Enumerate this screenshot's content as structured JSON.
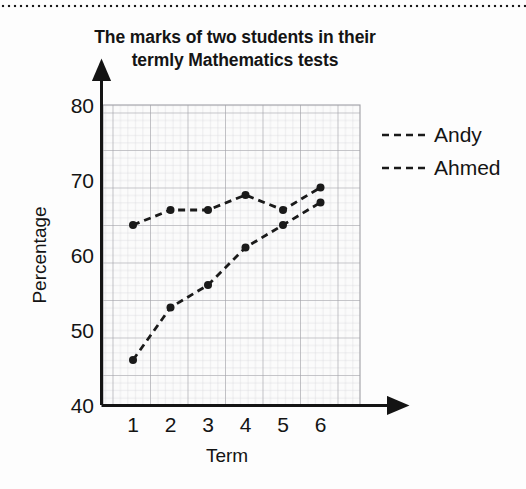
{
  "chart_data": {
    "type": "line",
    "title": "The marks of two students in their termly Mathematics tests",
    "title_line1": "The marks of two students in their",
    "title_line2": "termly Mathematics tests",
    "xlabel": "Term",
    "ylabel": "Percentage",
    "categories": [
      "1",
      "2",
      "3",
      "4",
      "5",
      "6"
    ],
    "x": [
      1,
      2,
      3,
      4,
      5,
      6
    ],
    "xlim": [
      0.4,
      6.6
    ],
    "ylim": [
      40,
      80
    ],
    "ytick_labels": [
      "40",
      "50",
      "60",
      "70",
      "80"
    ],
    "yticks": [
      40,
      50,
      60,
      70,
      80
    ],
    "xtick_labels": [
      "1",
      "2",
      "3",
      "4",
      "5",
      "6"
    ],
    "grid": true,
    "grid_minor": true,
    "legend_position": "right",
    "line_style": "dashed",
    "marker": "circle",
    "series": [
      {
        "name": "Andy",
        "values": [
          46,
          53,
          56,
          61,
          64,
          67
        ],
        "color": "#1a1a1a",
        "dash": "dashed"
      },
      {
        "name": "Ahmed",
        "values": [
          64,
          66,
          66,
          68,
          66,
          69
        ],
        "color": "#1a1a1a",
        "dash": "dashed"
      }
    ]
  },
  "legend": {
    "items": [
      {
        "label": "Andy"
      },
      {
        "label": "Ahmed"
      }
    ]
  },
  "colors": {
    "ink": "#1a1a1a",
    "grid_minor": "#d2d2d6",
    "grid_major": "#9a9aa0",
    "plot_bg": "#fbfbfb",
    "page_bg": "#fdfdfd"
  }
}
